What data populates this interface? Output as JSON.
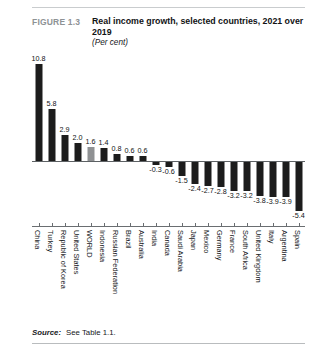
{
  "header": {
    "figure_number": "FIGURE 1.3",
    "title": "Real income growth, selected countries, 2021 over 2019",
    "units": "(Per cent)"
  },
  "footer": {
    "source_label": "Source:",
    "source_text": "See Table 1.1."
  },
  "colors": {
    "bar": "#1c1c1c",
    "bar_highlight": "#8f9193",
    "axis": "#6a6e71",
    "rule": "#c9ccce",
    "figure_number": "#8e9295"
  },
  "chart_data": {
    "type": "bar",
    "title": "Real income growth, selected countries, 2021 over 2019",
    "subtitle": "(Per cent)",
    "xlabel": "",
    "ylabel": "",
    "ylim": [
      -5.4,
      10.8
    ],
    "grid": false,
    "legend": "none",
    "highlight_category": "WORLD",
    "categories": [
      "China",
      "Turkey",
      "Republic of Korea",
      "United States",
      "WORLD",
      "Indonesia",
      "Russian Federation",
      "Brazil",
      "Australia",
      "India",
      "Canada",
      "Saudi Arabia",
      "Japan",
      "Mexico",
      "Germany",
      "France",
      "South Africa",
      "United Kingdom",
      "Italy",
      "Argentina",
      "Spain"
    ],
    "values": [
      10.8,
      5.8,
      2.9,
      2.0,
      1.6,
      1.4,
      0.8,
      0.6,
      0.6,
      -0.3,
      -0.6,
      -1.5,
      -2.4,
      -2.7,
      -2.8,
      -3.2,
      -3.2,
      -3.8,
      -3.9,
      -3.9,
      -5.4
    ],
    "value_labels": [
      "10.8",
      "5.8",
      "2.9",
      "2.0",
      "1.6",
      "1.4",
      "0.8",
      "0.6",
      "0.6",
      "-0.3",
      "-0.6",
      "-1.5",
      "-2.4",
      "-2.7",
      "-2.8",
      "-3.2",
      "-3.2",
      "-3.8",
      "-3.9",
      "-3.9",
      "-5.4"
    ]
  }
}
